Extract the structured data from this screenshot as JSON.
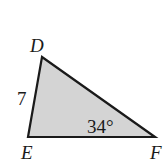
{
  "figure": {
    "type": "triangle",
    "fill_color": "#d4d4d4",
    "stroke_color": "#1a1a1a",
    "vertices": {
      "D": {
        "label": "D",
        "x": 42,
        "y": 57
      },
      "E": {
        "label": "E",
        "x": 28,
        "y": 137
      },
      "F": {
        "label": "F",
        "x": 155,
        "y": 137
      }
    },
    "side_labels": {
      "DE": "7"
    },
    "angle_labels": {
      "F": "34°"
    }
  }
}
